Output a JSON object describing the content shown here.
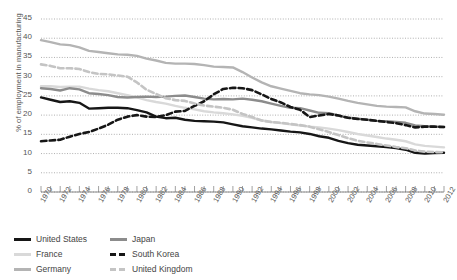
{
  "chart_data": {
    "type": "line",
    "title": "",
    "xlabel": "",
    "ylabel": "% of employment in manufacturing",
    "xlim": [
      1970,
      2012
    ],
    "ylim": [
      0,
      45
    ],
    "ytick_step": 5,
    "xtick_step": 2,
    "grid": "horizontal-dotted",
    "legend_position": "bottom-left",
    "yticks": [
      "0",
      "5",
      "10",
      "15",
      "20",
      "25",
      "30",
      "35",
      "40",
      "45"
    ],
    "x": [
      1970,
      1971,
      1972,
      1973,
      1974,
      1975,
      1976,
      1977,
      1978,
      1979,
      1980,
      1981,
      1982,
      1983,
      1984,
      1985,
      1986,
      1987,
      1988,
      1989,
      1990,
      1991,
      1992,
      1993,
      1994,
      1995,
      1996,
      1997,
      1998,
      1999,
      2000,
      2001,
      2002,
      2003,
      2004,
      2005,
      2006,
      2007,
      2008,
      2009,
      2010,
      2011,
      2012
    ],
    "xticks": [
      "1970",
      "1972",
      "1974",
      "1976",
      "1978",
      "1980",
      "1982",
      "1984",
      "1986",
      "1988",
      "1990",
      "1992",
      "1994",
      "1996",
      "1998",
      "2000",
      "2002",
      "2004",
      "2006",
      "2008",
      "2010",
      "2012"
    ],
    "series": [
      {
        "name": "United States",
        "color": "#161616",
        "style": "solid",
        "width": 2.4,
        "values": [
          24.6,
          24.0,
          23.4,
          23.6,
          23.2,
          21.7,
          21.8,
          21.9,
          21.9,
          21.8,
          21.3,
          20.7,
          19.6,
          19.2,
          19.3,
          18.8,
          18.5,
          18.4,
          18.3,
          18.1,
          17.6,
          17.1,
          16.8,
          16.5,
          16.3,
          16.0,
          15.7,
          15.5,
          15.1,
          14.5,
          14.1,
          13.3,
          12.7,
          12.3,
          12.1,
          11.9,
          11.7,
          11.4,
          11.0,
          10.2,
          10.0,
          10.1,
          10.2
        ]
      },
      {
        "name": "France",
        "color": "#d9d9d9",
        "style": "solid",
        "width": 2.4,
        "values": [
          27.5,
          27.5,
          27.3,
          27.4,
          27.4,
          26.9,
          26.5,
          26.2,
          25.7,
          25.2,
          24.6,
          23.9,
          23.4,
          23.0,
          22.4,
          21.9,
          21.5,
          21.0,
          20.7,
          20.5,
          20.2,
          19.8,
          19.3,
          18.6,
          18.2,
          17.9,
          17.6,
          17.3,
          17.0,
          16.8,
          16.5,
          16.1,
          15.6,
          15.1,
          14.7,
          14.3,
          13.9,
          13.6,
          13.2,
          12.4,
          12.0,
          11.8,
          11.6
        ]
      },
      {
        "name": "Germany",
        "color": "#b4b4b4",
        "style": "solid",
        "width": 2.4,
        "values": [
          39.5,
          39.0,
          38.4,
          38.2,
          37.6,
          36.7,
          36.4,
          36.1,
          35.8,
          35.7,
          35.4,
          34.7,
          34.2,
          33.6,
          33.4,
          33.4,
          33.3,
          33.0,
          32.6,
          32.5,
          32.4,
          31.2,
          29.8,
          28.5,
          27.5,
          26.9,
          26.3,
          25.7,
          25.4,
          25.2,
          24.8,
          24.3,
          23.7,
          23.2,
          22.8,
          22.4,
          22.2,
          22.1,
          22.0,
          21.0,
          20.4,
          20.3,
          20.1
        ]
      },
      {
        "name": "Japan",
        "color": "#8c8c8c",
        "style": "solid",
        "width": 2.4,
        "values": [
          27.0,
          26.8,
          26.4,
          27.0,
          26.7,
          25.7,
          25.5,
          25.2,
          24.7,
          24.6,
          24.7,
          24.8,
          24.7,
          24.8,
          25.0,
          25.1,
          24.7,
          24.3,
          24.1,
          24.2,
          24.1,
          24.3,
          24.0,
          23.6,
          23.0,
          22.4,
          21.9,
          21.8,
          21.2,
          20.6,
          20.5,
          19.9,
          19.3,
          19.1,
          18.8,
          18.5,
          18.4,
          18.2,
          18.0,
          17.3,
          17.1,
          17.0,
          16.9
        ]
      },
      {
        "name": "South Korea",
        "color": "#161616",
        "style": "dashed",
        "width": 2.6,
        "values": [
          13.2,
          13.4,
          13.6,
          14.4,
          15.1,
          15.6,
          16.5,
          17.5,
          18.8,
          19.6,
          20.0,
          19.6,
          19.5,
          20.0,
          20.9,
          21.1,
          22.4,
          23.6,
          25.4,
          26.8,
          27.1,
          27.0,
          26.5,
          25.4,
          24.2,
          23.3,
          22.1,
          21.4,
          19.5,
          19.9,
          20.3,
          19.9,
          19.3,
          19.0,
          18.8,
          18.5,
          18.2,
          17.9,
          17.4,
          16.8,
          17.0,
          17.0,
          16.9
        ]
      },
      {
        "name": "United Kingdom",
        "color": "#c4c4c4",
        "style": "dashed",
        "width": 2.6,
        "values": [
          33.2,
          32.8,
          32.2,
          32.2,
          32.0,
          31.2,
          30.7,
          30.6,
          30.3,
          30.0,
          28.5,
          26.6,
          25.5,
          24.4,
          23.9,
          23.7,
          23.0,
          22.5,
          22.2,
          21.9,
          21.4,
          20.3,
          19.5,
          18.6,
          18.2,
          18.0,
          17.7,
          17.4,
          17.0,
          16.3,
          15.6,
          14.8,
          14.0,
          13.3,
          12.9,
          12.5,
          12.1,
          11.7,
          11.4,
          10.8,
          10.5,
          10.4,
          10.3
        ]
      }
    ]
  },
  "legend": {
    "items": [
      {
        "label": "United States",
        "key": "united-states"
      },
      {
        "label": "Japan",
        "key": "japan"
      },
      {
        "label": "France",
        "key": "france"
      },
      {
        "label": "South Korea",
        "key": "south-korea"
      },
      {
        "label": "Germany",
        "key": "germany"
      },
      {
        "label": "United Kingdom",
        "key": "united-kingdom"
      }
    ]
  }
}
